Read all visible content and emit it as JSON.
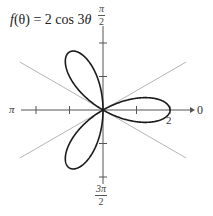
{
  "chart_data": {
    "type": "line",
    "coordinate_system": "polar",
    "title": "f(θ) = 2 cos 3θ",
    "function": {
      "expression": "r = 2 cos 3θ",
      "amplitude": 2,
      "frequency": 3,
      "petals": 3
    },
    "axis_labels": {
      "right": "0",
      "top": "π/2",
      "left": "π",
      "bottom": "3π/2"
    },
    "tick_labels": [
      {
        "value": 2,
        "position": "polar axis, r = 2"
      }
    ],
    "radial_ticks": [
      1,
      2
    ],
    "rlim": [
      0,
      2.5
    ],
    "reference_lines_degrees": [
      30,
      150
    ],
    "petal_tips": [
      {
        "theta_deg": 0,
        "r": 2
      },
      {
        "theta_deg": 120,
        "r": 2
      },
      {
        "theta_deg": 240,
        "r": 2
      }
    ],
    "grid": false,
    "legend": null
  },
  "labels": {
    "title_func": "f",
    "title_arg": "(θ)",
    "title_eq": " = 2 cos 3",
    "title_theta": "θ",
    "top_num": "π",
    "top_den": "2",
    "bottom_num": "3π",
    "bottom_den": "2",
    "left": "π",
    "right": "0",
    "r_value": "2"
  },
  "colors": {
    "curve": "#1a1a1a",
    "axis": "#555555",
    "reference_line": "#b5b5b5",
    "background": "#ffffff"
  }
}
